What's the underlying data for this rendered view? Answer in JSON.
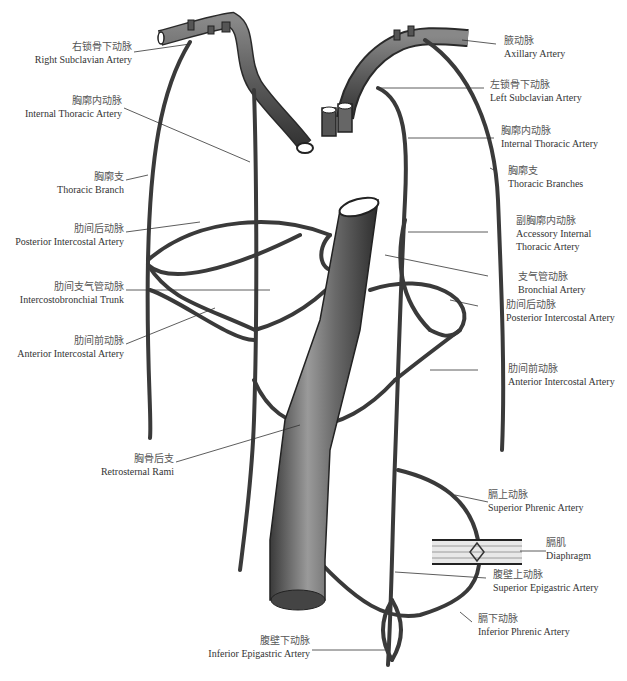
{
  "diagram": {
    "accent_colors": {
      "vessel_fill": "#5a5a5a",
      "vessel_outline": "#2a2a2a",
      "leader_line": "#333333",
      "background": "#ffffff"
    },
    "labels_left": [
      {
        "id": "right-subclavian",
        "zh": "右锁骨下动脉",
        "en": "Right Subclavian Artery"
      },
      {
        "id": "internal-thoracic-left",
        "zh": "胸廓内动脉",
        "en": "Internal Thoracic Artery"
      },
      {
        "id": "thoracic-branch",
        "zh": "胸廓支",
        "en": "Thoracic Branch"
      },
      {
        "id": "posterior-intercostal-left",
        "zh": "肋间后动脉",
        "en": "Posterior Intercostal Artery"
      },
      {
        "id": "intercostobronchial-trunk",
        "zh": "肋间支气管动脉",
        "en": "Intercostobronchial Trunk"
      },
      {
        "id": "anterior-intercostal-left",
        "zh": "肋间前动脉",
        "en": "Anterior Intercostal Artery"
      },
      {
        "id": "retrosternal-rami",
        "zh": "胸骨后支",
        "en": "Retrosternal Rami"
      },
      {
        "id": "inferior-epigastric",
        "zh": "腹壁下动脉",
        "en": "Inferior Epigastric Artery"
      }
    ],
    "labels_right": [
      {
        "id": "axillary",
        "zh": "腋动脉",
        "en": "Axillary Artery"
      },
      {
        "id": "left-subclavian",
        "zh": "左锁骨下动脉",
        "en": "Left Subclavian Artery"
      },
      {
        "id": "internal-thoracic-right",
        "zh": "胸廓内动脉",
        "en": "Internal Thoracic Artery"
      },
      {
        "id": "thoracic-branches",
        "zh": "胸廓支",
        "en": "Thoracic Branches"
      },
      {
        "id": "accessory-internal-thoracic",
        "zh": "副胸廓内动脉",
        "en": "Accessory Internal",
        "en2": "Thoracic Artery"
      },
      {
        "id": "bronchial",
        "zh": "支气管动脉",
        "en": "Bronchial Artery"
      },
      {
        "id": "posterior-intercostal-right",
        "zh": "肋间后动脉",
        "en": "Posterior Intercostal Artery"
      },
      {
        "id": "anterior-intercostal-right",
        "zh": "肋间前动脉",
        "en": "Anterior Intercostal Artery"
      },
      {
        "id": "superior-phrenic",
        "zh": "膈上动脉",
        "en": "Superior Phrenic Artery"
      },
      {
        "id": "diaphragm",
        "zh": "膈肌",
        "en": "Diaphragm"
      },
      {
        "id": "superior-epigastric",
        "zh": "腹壁上动脉",
        "en": "Superior Epigastric Artery"
      },
      {
        "id": "inferior-phrenic",
        "zh": "膈下动脉",
        "en": "Inferior Phrenic Artery"
      }
    ]
  }
}
